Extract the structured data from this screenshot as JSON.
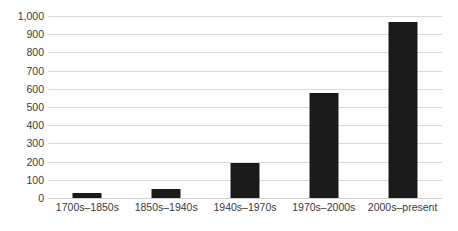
{
  "chart_data": {
    "type": "bar",
    "title": "",
    "subtitle": "",
    "xlabel": "",
    "ylabel": "",
    "categories": [
      "1700s–1850s",
      "1850s–1940s",
      "1940s–1970s",
      "1970s–2000s",
      "2000s–present"
    ],
    "values": [
      30,
      50,
      190,
      575,
      965
    ],
    "ylim": [
      0,
      1000
    ],
    "yticks": [
      0,
      100,
      200,
      300,
      400,
      500,
      600,
      700,
      800,
      900,
      1000
    ],
    "ytick_labels": [
      "0",
      "100",
      "200",
      "300",
      "400",
      "500",
      "600",
      "700",
      "800",
      "900",
      "1,000"
    ],
    "grid": true,
    "legend": false,
    "series": [
      {
        "name": "",
        "values": [
          30,
          50,
          190,
          575,
          965
        ]
      }
    ],
    "colors": {
      "bar": "#1a1a1a",
      "gridline": "#d9d9d9",
      "text": "#3a3a3a",
      "background": "#ffffff"
    }
  }
}
